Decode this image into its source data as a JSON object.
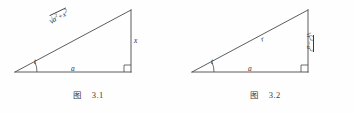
{
  "page": {
    "background_color": "#fefefe",
    "ink_color": "#3a3a3a"
  },
  "figures": [
    {
      "id": "figure-1",
      "caption_cjk": "图",
      "caption_number": "3.1",
      "labels": {
        "hypotenuse_prefix": "",
        "hypotenuse_radicand_a": "a",
        "hypotenuse_radicand_a_exp": "2",
        "hypotenuse_plus": "+",
        "hypotenuse_radicand_x": "x",
        "hypotenuse_radicand_x_exp": "2",
        "angle": "t",
        "base": "a",
        "vertical_side": "x"
      },
      "geometry": {
        "apex_x": 15,
        "apex_y": 72,
        "corner_x": 131,
        "corner_y": 72,
        "top_x": 131,
        "top_y": 10,
        "right_angle_size": 7,
        "arc_radius": 22
      }
    },
    {
      "id": "figure-2",
      "caption_cjk": "图",
      "caption_number": "3.2",
      "labels": {
        "hypotenuse": "r",
        "angle": "t",
        "base": "a",
        "vertical_radicand_r": "r",
        "vertical_radicand_r_exp": "2",
        "vertical_minus": "−",
        "vertical_radicand_a": "a",
        "vertical_radicand_a_exp": "2"
      },
      "geometry": {
        "apex_x": 15,
        "apex_y": 72,
        "corner_x": 131,
        "corner_y": 72,
        "top_x": 131,
        "top_y": 10,
        "right_angle_size": 7,
        "arc_radius": 22
      }
    }
  ]
}
